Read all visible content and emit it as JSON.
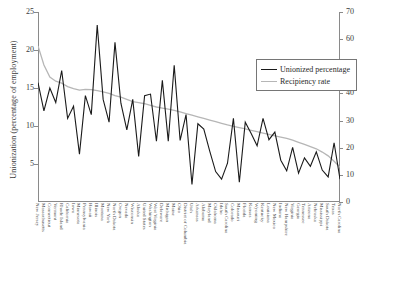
{
  "chart_data": {
    "type": "line",
    "title": "",
    "xlabel": "",
    "ylabel": "Unionization (percentage of employment)",
    "ylabel_right": "UI recipiency rate (percentage of unemployed)",
    "ylim": [
      0,
      25
    ],
    "ylim_right": [
      0,
      70
    ],
    "yticks": [
      5,
      10,
      15,
      20,
      25
    ],
    "yticks_right": [
      0,
      10,
      20,
      30,
      40,
      50,
      60,
      70
    ],
    "grid": false,
    "legend_position": "top-center-right",
    "categories": [
      "New Jersey",
      "Massachusetts",
      "Connecticut",
      "Vermont",
      "Rhode Island",
      "California",
      "Iowa",
      "Minnesota",
      "Pennsylvania",
      "Hawaii",
      "Illinois",
      "Montana",
      "New York",
      "North Dakota",
      "Oregon",
      "Nevada",
      "Wisconsin",
      "Alaska",
      "United States",
      "Washington",
      "West Virginia",
      "Delaware",
      "Michigan",
      "Maine",
      "Ohio",
      "District of Columbia",
      "Utah",
      "Arkansas",
      "Alabama",
      "Maryland",
      "Oklahoma",
      "Idaho",
      "South Carolina",
      "Colorado",
      "Missouri",
      "Florida",
      "Kansas",
      "Wyoming",
      "Kentucky",
      "Louisiana",
      "New Mexico",
      "Indiana",
      "New Hampshire",
      "Virginia",
      "Georgia",
      "Tennessee",
      "Arizona",
      "Nebraska",
      "Mississippi",
      "South Dakota",
      "Texas",
      "North Carolina"
    ],
    "series": [
      {
        "name": "Unionized percentage",
        "color": "#1a1a1a",
        "axis": "left",
        "values": [
          15.7,
          12.0,
          15.0,
          13.1,
          17.3,
          11.0,
          12.6,
          6.3,
          14.0,
          11.5,
          23.3,
          13.5,
          10.5,
          21.0,
          13.0,
          9.5,
          13.5,
          6.0,
          14.0,
          14.2,
          8.0,
          16.0,
          8.0,
          18.0,
          8.1,
          11.5,
          2.3,
          10.3,
          9.6,
          6.7,
          4.0,
          3.0,
          5.1,
          11.0,
          2.6,
          10.5,
          9.0,
          7.4,
          11.0,
          8.2,
          9.2,
          5.5,
          4.1,
          7.2,
          3.8,
          5.8,
          4.7,
          6.6,
          4.2,
          3.3,
          7.8,
          3.0
        ]
      },
      {
        "name": "Recipiency rate",
        "color": "#b6b6b6",
        "axis": "right",
        "values": [
          57.5,
          50.5,
          46.0,
          44.5,
          43.8,
          42.5,
          41.8,
          41.2,
          41.5,
          41.4,
          41.0,
          40.6,
          40.0,
          39.2,
          38.6,
          37.8,
          37.0,
          36.6,
          36.2,
          35.6,
          35.0,
          34.6,
          34.2,
          33.8,
          33.2,
          32.6,
          32.0,
          31.4,
          30.8,
          30.2,
          29.6,
          29.0,
          28.4,
          27.9,
          27.4,
          26.9,
          26.4,
          25.9,
          25.4,
          24.9,
          24.4,
          23.9,
          23.4,
          22.8,
          22.0,
          21.2,
          20.4,
          19.6,
          18.4,
          17.0,
          15.0,
          12.8
        ]
      }
    ]
  },
  "legend": {
    "items": [
      {
        "label": "Unionized percentage"
      },
      {
        "label": "Recipiency rate"
      }
    ]
  }
}
